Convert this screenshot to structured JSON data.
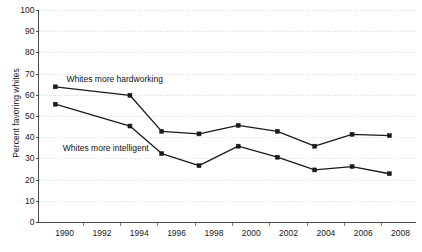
{
  "chart_data": {
    "type": "line",
    "title": "",
    "xlabel": "",
    "ylabel": "Percent favoring whites",
    "xlim": [
      1988.6,
      2008.8
    ],
    "ylim": [
      0,
      100
    ],
    "ytick_step": 10,
    "yticks": [
      0,
      10,
      20,
      30,
      40,
      50,
      60,
      70,
      80,
      90,
      100
    ],
    "xticks": [
      1990,
      1992,
      1994,
      1996,
      1998,
      2000,
      2002,
      2004,
      2006,
      2008
    ],
    "xtick_labels": [
      "1990",
      "1992",
      "1994",
      "1996",
      "1998",
      "2000",
      "2002",
      "2004",
      "2006",
      "2008"
    ],
    "ytick_labels": [
      "0",
      "10",
      "20",
      "30",
      "40",
      "50",
      "60",
      "70",
      "80",
      "90",
      "100"
    ],
    "grid": true,
    "grid_color": "#d9d9d9",
    "legend_position": "inline-annotation",
    "line_color": "#1a1a1a",
    "marker": "square",
    "x": [
      1989.5,
      1993.5,
      1995.2,
      1997.2,
      1999.3,
      2001.4,
      2003.4,
      2005.4,
      2007.4
    ],
    "series": [
      {
        "name": "Whites more hardworking",
        "label_x": 1990.1,
        "label_y": 67.5,
        "values": [
          64.0,
          60.0,
          43.0,
          41.8,
          45.8,
          43.0,
          36.0,
          41.6,
          41.0
        ]
      },
      {
        "name": "Whites more intelligent",
        "label_x": 1989.9,
        "label_y": 35.0,
        "values": [
          55.8,
          45.5,
          32.5,
          26.8,
          36.0,
          30.8,
          24.8,
          26.4,
          23.0
        ]
      }
    ]
  }
}
